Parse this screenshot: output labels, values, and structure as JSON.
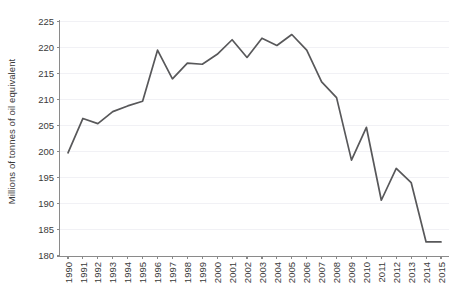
{
  "chart_data": {
    "type": "line",
    "title": "",
    "subtitle": "",
    "xlabel": "",
    "ylabel": "Millions of tonnes of oil equivalent",
    "ylim": [
      180,
      225
    ],
    "ytick_labels": [
      "180",
      "185",
      "190",
      "195",
      "200",
      "205",
      "210",
      "215",
      "220",
      "225"
    ],
    "ytick_values": [
      180,
      185,
      190,
      195,
      200,
      205,
      210,
      215,
      220,
      225
    ],
    "grid": true,
    "legend": "none",
    "categories": [
      "1990",
      "1991",
      "1992",
      "1993",
      "1994",
      "1995",
      "1996",
      "1997",
      "1998",
      "1999",
      "2000",
      "2001",
      "2002",
      "2003",
      "2004",
      "2005",
      "2006",
      "2007",
      "2008",
      "2009",
      "2010",
      "2011",
      "2012",
      "2013",
      "2014",
      "2015"
    ],
    "values": [
      199.8,
      206.4,
      205.4,
      207.7,
      208.8,
      209.7,
      219.5,
      214.0,
      217.0,
      216.8,
      218.7,
      221.5,
      218.1,
      221.8,
      220.4,
      222.5,
      219.5,
      213.4,
      210.4,
      198.4,
      204.7,
      190.7,
      196.8,
      194.1,
      182.7,
      182.7
    ],
    "series_color": "#58585a",
    "grid_color": "#f1f1f5",
    "axis_color": "#8a8a8a",
    "background_color": "#ffffff"
  }
}
